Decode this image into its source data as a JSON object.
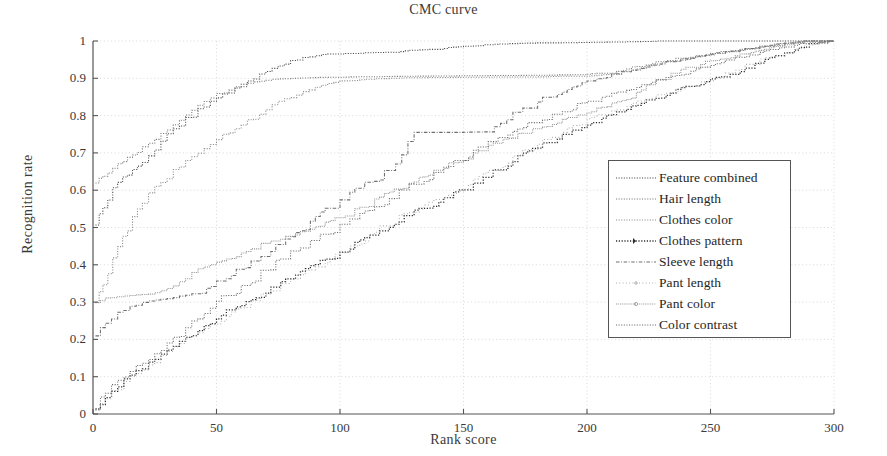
{
  "chart_data": {
    "type": "line",
    "title": "CMC curve",
    "xlabel": "Rank score",
    "ylabel": "Recognition rate",
    "xlim": [
      0,
      300
    ],
    "ylim": [
      0,
      1
    ],
    "xticks": [
      0,
      50,
      100,
      150,
      200,
      250,
      300
    ],
    "yticks": [
      0,
      0.1,
      0.2,
      0.3,
      0.4,
      0.5,
      0.6,
      0.7,
      0.8,
      0.9,
      1
    ],
    "xtick_labels": [
      "0",
      "50",
      "100",
      "150",
      "200",
      "250",
      "300"
    ],
    "ytick_labels": [
      "0",
      "0.1",
      "0.2",
      "0.3",
      "0.4",
      "0.5",
      "0.6",
      "0.7",
      "0.8",
      "0.9",
      "1"
    ],
    "grid": true,
    "legend_position": "center-right",
    "series": [
      {
        "name": "Feature combined",
        "style": "dotted",
        "color": "#4a4a4a",
        "x": [
          1,
          4,
          8,
          12,
          16,
          20,
          25,
          30,
          35,
          40,
          45,
          50,
          55,
          60,
          65,
          70,
          75,
          80,
          85,
          90,
          95,
          100,
          110,
          120,
          130,
          140,
          150,
          160,
          170,
          180,
          190,
          200,
          210,
          220,
          230,
          250,
          270,
          290,
          300
        ],
        "y": [
          0.51,
          0.555,
          0.6,
          0.635,
          0.655,
          0.675,
          0.715,
          0.745,
          0.775,
          0.8,
          0.825,
          0.845,
          0.865,
          0.885,
          0.9,
          0.915,
          0.93,
          0.945,
          0.955,
          0.96,
          0.965,
          0.965,
          0.968,
          0.97,
          0.975,
          0.978,
          0.985,
          0.99,
          0.993,
          0.995,
          0.995,
          0.996,
          0.997,
          0.998,
          1.0,
          1.0,
          1.0,
          1.0,
          1.0
        ]
      },
      {
        "name": "Hair length",
        "style": "dotted",
        "color": "#7a7a7a",
        "x": [
          1,
          4,
          8,
          12,
          16,
          20,
          25,
          30,
          35,
          40,
          45,
          50,
          55,
          60,
          65,
          70,
          75,
          80,
          90,
          100,
          120,
          140,
          160,
          180,
          200,
          210,
          220,
          230,
          240,
          250,
          260,
          270,
          280,
          290,
          300
        ],
        "y": [
          0.62,
          0.64,
          0.66,
          0.675,
          0.695,
          0.715,
          0.74,
          0.765,
          0.79,
          0.815,
          0.835,
          0.855,
          0.87,
          0.88,
          0.89,
          0.895,
          0.898,
          0.9,
          0.902,
          0.903,
          0.905,
          0.906,
          0.907,
          0.908,
          0.91,
          0.915,
          0.93,
          0.945,
          0.955,
          0.965,
          0.975,
          0.985,
          0.993,
          1.0,
          1.0
        ]
      },
      {
        "name": "Clothes color",
        "style": "dotted",
        "color": "#8c8c8c",
        "x": [
          1,
          4,
          8,
          12,
          16,
          20,
          25,
          30,
          35,
          40,
          45,
          50,
          55,
          60,
          65,
          70,
          75,
          80,
          85,
          90,
          95,
          100,
          110,
          120,
          140,
          160,
          180,
          200,
          210,
          220,
          230,
          240,
          250,
          260,
          270,
          280,
          290,
          300
        ],
        "y": [
          0.305,
          0.34,
          0.4,
          0.47,
          0.525,
          0.565,
          0.6,
          0.635,
          0.665,
          0.69,
          0.715,
          0.735,
          0.755,
          0.775,
          0.795,
          0.815,
          0.835,
          0.85,
          0.865,
          0.875,
          0.885,
          0.892,
          0.897,
          0.9,
          0.902,
          0.903,
          0.904,
          0.906,
          0.91,
          0.925,
          0.94,
          0.952,
          0.962,
          0.972,
          0.982,
          0.992,
          1.0,
          1.0
        ]
      },
      {
        "name": "Clothes pattern",
        "style": "solid",
        "color": "#2d2d2d",
        "x": [
          1,
          5,
          10,
          15,
          20,
          25,
          30,
          35,
          40,
          45,
          50,
          60,
          70,
          80,
          90,
          100,
          110,
          120,
          130,
          140,
          150,
          160,
          170,
          180,
          190,
          200,
          210,
          220,
          230,
          240,
          250,
          260,
          270,
          280,
          290,
          300
        ],
        "y": [
          0.012,
          0.045,
          0.075,
          0.105,
          0.125,
          0.145,
          0.17,
          0.195,
          0.215,
          0.235,
          0.255,
          0.29,
          0.325,
          0.36,
          0.395,
          0.43,
          0.465,
          0.505,
          0.54,
          0.57,
          0.6,
          0.635,
          0.675,
          0.715,
          0.745,
          0.775,
          0.8,
          0.825,
          0.85,
          0.875,
          0.895,
          0.915,
          0.94,
          0.965,
          0.99,
          1.0
        ]
      },
      {
        "name": "Sleeve length",
        "style": "dashdot",
        "color": "#6e6e6e",
        "x": [
          1,
          5,
          10,
          15,
          20,
          25,
          30,
          35,
          40,
          50,
          60,
          70,
          80,
          90,
          100,
          110,
          120,
          125,
          130,
          135,
          150,
          160,
          165,
          170,
          180,
          190,
          200,
          210,
          220,
          230,
          240,
          250,
          260,
          270,
          280,
          290,
          300
        ],
        "y": [
          0.21,
          0.245,
          0.27,
          0.285,
          0.3,
          0.305,
          0.31,
          0.315,
          0.32,
          0.345,
          0.385,
          0.43,
          0.475,
          0.52,
          0.565,
          0.61,
          0.655,
          0.7,
          0.755,
          0.755,
          0.755,
          0.757,
          0.775,
          0.8,
          0.835,
          0.865,
          0.89,
          0.91,
          0.925,
          0.94,
          0.952,
          0.963,
          0.974,
          0.984,
          0.993,
          1.0,
          1.0
        ]
      },
      {
        "name": "Pant length",
        "style": "dotted-light",
        "color": "#a5a5a5",
        "x": [
          1,
          5,
          10,
          15,
          20,
          25,
          30,
          35,
          40,
          45,
          50,
          60,
          70,
          80,
          90,
          100,
          110,
          120,
          130,
          140,
          150,
          160,
          170,
          180,
          190,
          200,
          210,
          220,
          230,
          240,
          250,
          260,
          270,
          280,
          290,
          300
        ],
        "y": [
          0.012,
          0.04,
          0.07,
          0.1,
          0.12,
          0.14,
          0.165,
          0.19,
          0.21,
          0.23,
          0.25,
          0.285,
          0.32,
          0.355,
          0.39,
          0.425,
          0.47,
          0.51,
          0.545,
          0.575,
          0.605,
          0.645,
          0.685,
          0.72,
          0.755,
          0.785,
          0.81,
          0.835,
          0.855,
          0.875,
          0.895,
          0.92,
          0.945,
          0.968,
          0.99,
          1.0
        ]
      },
      {
        "name": "Pant color",
        "style": "dotted-dense",
        "color": "#909090",
        "x": [
          1,
          5,
          10,
          15,
          20,
          25,
          30,
          35,
          40,
          45,
          50,
          60,
          70,
          80,
          90,
          100,
          110,
          120,
          130,
          140,
          150,
          160,
          170,
          180,
          190,
          200,
          210,
          220,
          230,
          240,
          250,
          260,
          270,
          280,
          290,
          300
        ],
        "y": [
          0.3,
          0.31,
          0.315,
          0.318,
          0.32,
          0.325,
          0.335,
          0.35,
          0.375,
          0.395,
          0.405,
          0.43,
          0.455,
          0.475,
          0.5,
          0.525,
          0.555,
          0.59,
          0.62,
          0.655,
          0.685,
          0.715,
          0.74,
          0.765,
          0.785,
          0.805,
          0.83,
          0.86,
          0.895,
          0.925,
          0.945,
          0.962,
          0.977,
          0.988,
          1.0,
          1.0
        ]
      },
      {
        "name": "Color contrast",
        "style": "dotted",
        "color": "#6b6b6b",
        "x": [
          1,
          5,
          10,
          15,
          20,
          25,
          30,
          35,
          40,
          45,
          50,
          60,
          70,
          80,
          90,
          100,
          110,
          120,
          130,
          140,
          150,
          160,
          170,
          180,
          190,
          200,
          210,
          220,
          230,
          240,
          250,
          260,
          270,
          280,
          290,
          300
        ],
        "y": [
          0.02,
          0.06,
          0.09,
          0.115,
          0.135,
          0.155,
          0.185,
          0.215,
          0.245,
          0.27,
          0.295,
          0.34,
          0.385,
          0.425,
          0.465,
          0.5,
          0.535,
          0.575,
          0.615,
          0.65,
          0.685,
          0.72,
          0.755,
          0.785,
          0.81,
          0.835,
          0.855,
          0.875,
          0.895,
          0.915,
          0.935,
          0.952,
          0.968,
          0.982,
          0.995,
          1.0
        ]
      }
    ]
  },
  "legend": {
    "items": [
      "Feature combined",
      "Hair length",
      "Clothes color",
      "Clothes pattern",
      "Sleeve length",
      "Pant length",
      "Pant color",
      "Color contrast"
    ]
  },
  "colors": {
    "axis": "#555555",
    "grid": "#c8c8c8",
    "text": "#2b2b2b",
    "background": "#ffffff"
  }
}
